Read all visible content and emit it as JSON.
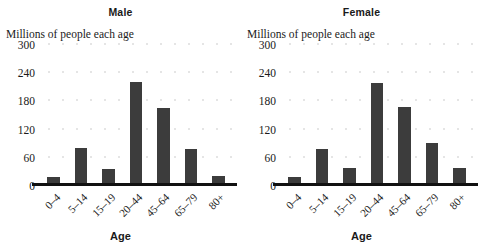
{
  "chart_data": {
    "type": "bar",
    "title": "Millions of people each age",
    "xlabel": "Age",
    "ylabel": "Millions of people each age",
    "ylim": [
      0,
      300
    ],
    "yticks": [
      0,
      60,
      120,
      180,
      240,
      300
    ],
    "grid": true,
    "legend": "none",
    "categories": [
      "0–4",
      "5–14",
      "15–19",
      "20–44",
      "45–64",
      "65–79",
      "80+"
    ],
    "panels": [
      {
        "name": "Male",
        "values": [
          20,
          80,
          37,
          222,
          165,
          78,
          22
        ]
      },
      {
        "name": "Female",
        "values": [
          20,
          78,
          38,
          220,
          168,
          92,
          38
        ]
      }
    ]
  },
  "panels": [
    {
      "title": "Male",
      "axis_caption": "Millions of people each age",
      "x_axis_title": "Age",
      "yticks": [
        "300",
        "240",
        "180",
        "120",
        "60",
        "0"
      ],
      "xlabels": [
        "0–4",
        "5–14",
        "15–19",
        "20–44",
        "45–64",
        "65–79",
        "80+"
      ]
    },
    {
      "title": "Female",
      "axis_caption": "Millions of people each age",
      "x_axis_title": "Age",
      "yticks": [
        "300",
        "240",
        "180",
        "120",
        "60",
        "0"
      ],
      "xlabels": [
        "0–4",
        "5–14",
        "15–19",
        "20–44",
        "45–64",
        "65–79",
        "80+"
      ]
    }
  ],
  "style": {
    "bar_color": "#3c3c3c",
    "axis_color": "#111111",
    "grid_color": "#7a7a7a",
    "text_color": "#1a1a1a",
    "background": "#ffffff"
  }
}
